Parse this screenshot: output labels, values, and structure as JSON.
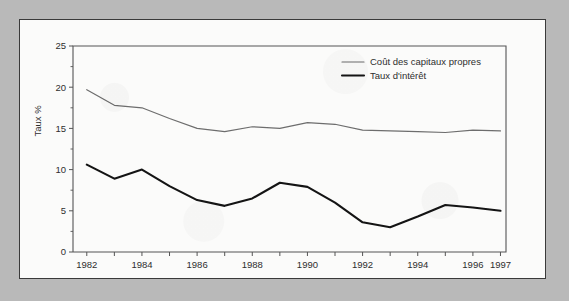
{
  "page": {
    "background_color": "#b9b9b9",
    "paper_color": "#fbfbfa",
    "border_color": "#3a3a3a"
  },
  "chart_data": {
    "type": "line",
    "title": "",
    "subtitle": "",
    "xlabel": "",
    "ylabel": "Taux %",
    "xlim": [
      1981.5,
      1997.2
    ],
    "ylim": [
      0,
      25
    ],
    "grid": false,
    "legend_position": "top-right",
    "y_ticks": [
      0,
      5,
      10,
      15,
      20,
      25
    ],
    "y_tick_labels": [
      "0",
      "5",
      "10",
      "15",
      "20",
      "25"
    ],
    "y_minor_ticks": [
      2.5,
      7.5,
      12.5,
      17.5,
      22.5
    ],
    "x_ticks": [
      1982,
      1983,
      1984,
      1985,
      1986,
      1987,
      1988,
      1989,
      1990,
      1991,
      1992,
      1993,
      1994,
      1995,
      1996,
      1997
    ],
    "x_tick_labels_shown": [
      "1982",
      "1984",
      "1986",
      "1988",
      "1990",
      "1992",
      "1994",
      "1996",
      "1997"
    ],
    "x_tick_labels_values": [
      1982,
      1984,
      1986,
      1988,
      1990,
      1992,
      1994,
      1996,
      1997
    ],
    "x": [
      1982,
      1983,
      1984,
      1985,
      1986,
      1987,
      1988,
      1989,
      1990,
      1991,
      1992,
      1993,
      1994,
      1995,
      1996,
      1997
    ],
    "series": [
      {
        "name": "Coût des capitaux propres",
        "style": "thin",
        "color": "#6d6d6d",
        "values": [
          19.7,
          17.8,
          17.5,
          16.2,
          15.0,
          14.6,
          15.2,
          15.0,
          15.7,
          15.5,
          14.8,
          14.7,
          14.6,
          14.5,
          14.8,
          14.7
        ]
      },
      {
        "name": "Taux d'intérêt",
        "style": "thick",
        "color": "#141414",
        "values": [
          10.6,
          8.9,
          10.0,
          8.0,
          6.3,
          5.6,
          6.5,
          8.4,
          7.9,
          6.0,
          3.6,
          3.0,
          4.3,
          5.7,
          5.4,
          5.0
        ]
      }
    ]
  },
  "legend": {
    "items": [
      {
        "label": "Coût des capitaux propres",
        "style": "thin"
      },
      {
        "label": "Taux d'intérêt",
        "style": "thick"
      }
    ]
  }
}
